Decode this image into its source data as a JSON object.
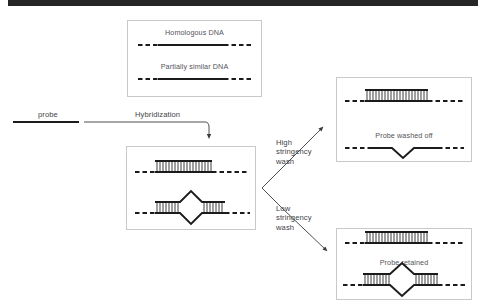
{
  "figure": {
    "title_bar": {
      "name": "top-black-bar",
      "color": "#262626"
    },
    "background": "#ffffff",
    "ink": "#1b1b1b",
    "text_color": "#4a4a4a",
    "border_color": "#c9c9c9"
  },
  "probe": {
    "label": "probe"
  },
  "steps": {
    "hybridization": "Hybridization",
    "high_stringency": "High\nstringency\nwash",
    "high_stringency_lines": [
      "High",
      "stringency",
      "wash"
    ],
    "low_stringency": "Low\nstringency\nwash",
    "low_stringency_lines": [
      "Low",
      "stringency",
      "wash"
    ]
  },
  "panels": {
    "start": {
      "name": "starting-dna-panel",
      "items": [
        {
          "label": "Homologous DNA",
          "type": "single-strand"
        },
        {
          "label": "Partially similar DNA",
          "type": "single-strand"
        }
      ]
    },
    "hybridized": {
      "name": "hybridized-duplex-panel",
      "items": [
        {
          "label": "",
          "type": "perfect-duplex"
        },
        {
          "label": "",
          "type": "bubble-duplex"
        }
      ]
    },
    "high_result": {
      "name": "high-stringency-result-panel",
      "items": [
        {
          "label": "",
          "type": "perfect-duplex"
        },
        {
          "label": "Probe washed off",
          "type": "notched-strand"
        }
      ]
    },
    "low_result": {
      "name": "low-stringency-result-panel",
      "items": [
        {
          "label": "",
          "type": "perfect-duplex"
        },
        {
          "label": "Probe retained",
          "type": "bubble-duplex"
        }
      ]
    }
  }
}
